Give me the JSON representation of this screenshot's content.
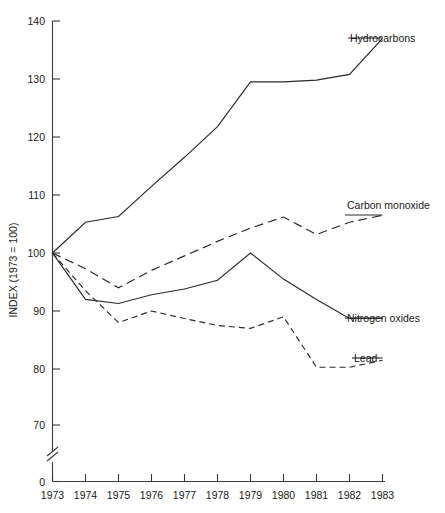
{
  "chart_data": {
    "type": "line",
    "title": "",
    "xlabel": "",
    "ylabel": "INDEX (1973 = 100)",
    "ylim": [
      0,
      140
    ],
    "y_axis_break": true,
    "y_break_below": 70,
    "yticks": [
      "0",
      "70",
      "80",
      "90",
      "100",
      "110",
      "120",
      "130",
      "140"
    ],
    "grid": false,
    "legend_position": "right-inline-labels",
    "x": [
      1973,
      1974,
      1975,
      1976,
      1977,
      1978,
      1979,
      1980,
      1981,
      1982,
      1983
    ],
    "categories": [
      "1973",
      "1974",
      "1975",
      "1976",
      "1977",
      "1978",
      "1979",
      "1980",
      "1981",
      "1982",
      "1983"
    ],
    "series": [
      {
        "name": "Hydrocarbons",
        "style": "solid",
        "values": [
          100,
          105.3,
          106.3,
          111.5,
          116.5,
          121.8,
          129.5,
          129.5,
          129.8,
          130.8,
          137.0
        ]
      },
      {
        "name": "Carbon monoxide",
        "style": "dashed-long",
        "values": [
          100,
          97.3,
          94.0,
          97.0,
          99.5,
          102.0,
          104.3,
          106.2,
          103.2,
          105.3,
          106.5
        ]
      },
      {
        "name": "Nitrogen oxides",
        "style": "solid",
        "values": [
          100,
          92.0,
          91.3,
          92.8,
          93.8,
          95.3,
          100.0,
          95.5,
          92.0,
          88.7,
          88.7
        ]
      },
      {
        "name": "Lead",
        "style": "dashed-short",
        "values": [
          100,
          93.5,
          88.0,
          90.0,
          88.7,
          87.5,
          87.0,
          89.0,
          80.3,
          80.3,
          81.5
        ]
      }
    ]
  }
}
